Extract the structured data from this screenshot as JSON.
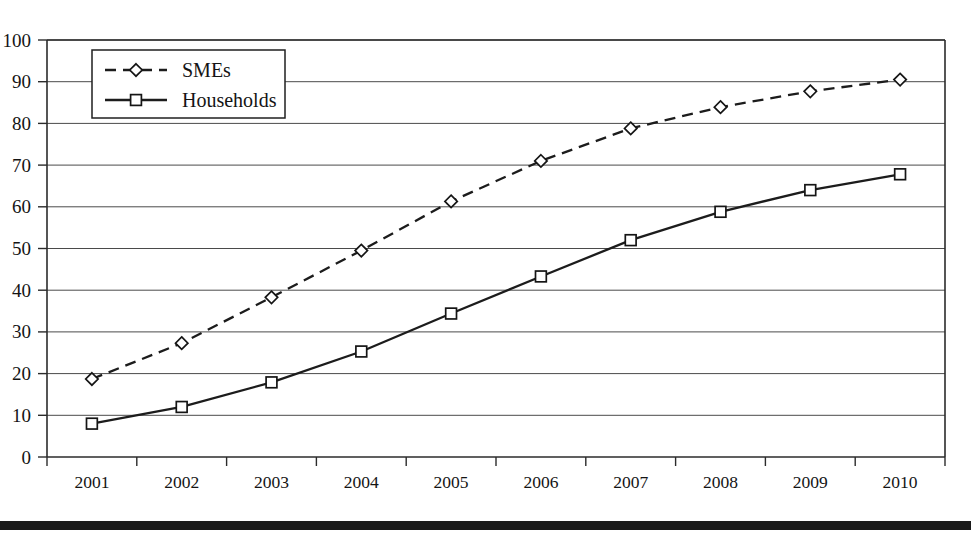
{
  "chart_data": {
    "type": "line",
    "title": "",
    "subtitle": "",
    "xlabel": "",
    "ylabel": "",
    "categories": [
      "2001",
      "2002",
      "2003",
      "2004",
      "2005",
      "2006",
      "2007",
      "2008",
      "2009",
      "2010"
    ],
    "series": [
      {
        "name": "SMEs",
        "values": [
          18.7,
          27.3,
          38.3,
          49.5,
          61.3,
          71.0,
          78.8,
          83.9,
          87.7,
          90.5
        ],
        "line_style": "dashed",
        "marker": "diamond",
        "color": "#1c1c1c"
      },
      {
        "name": "Households",
        "values": [
          8.0,
          12.0,
          17.9,
          25.3,
          34.4,
          43.3,
          52.0,
          58.8,
          64.0,
          67.8
        ],
        "line_style": "solid",
        "marker": "square",
        "color": "#1c1c1c"
      }
    ],
    "ylim": [
      0,
      100
    ],
    "ytick_step": 10,
    "ytick_labels": [
      "0",
      "10",
      "20",
      "30",
      "40",
      "50",
      "60",
      "70",
      "80",
      "90",
      "100"
    ],
    "grid": true,
    "grid_axis": "y",
    "legend_position": "top-left",
    "legend_entries": [
      "SMEs",
      "Households"
    ],
    "plot_background": "#ffffff",
    "axis_color": "#2b2b2b",
    "grid_color": "#4a4a4a"
  },
  "figure": {
    "bottom_rule_color": "#1b1b1b"
  }
}
